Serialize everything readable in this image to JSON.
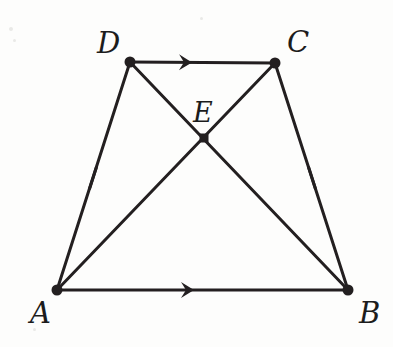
{
  "figure": {
    "background_color": "#fdfdfc",
    "stroke_color": "#231f20",
    "canvas": {
      "width": 393,
      "height": 347
    }
  },
  "points": [
    {
      "id": "A",
      "label": "A",
      "x": 57,
      "y": 290,
      "label_x": 30,
      "label_y": 299
    },
    {
      "id": "B",
      "label": "B",
      "x": 348,
      "y": 290,
      "label_x": 359,
      "label_y": 299
    },
    {
      "id": "C",
      "label": "C",
      "x": 275,
      "y": 63,
      "label_x": 287,
      "label_y": 28
    },
    {
      "id": "D",
      "label": "D",
      "x": 130,
      "y": 62,
      "label_x": 97,
      "label_y": 29
    },
    {
      "id": "E",
      "label": "E",
      "x": 204,
      "y": 138,
      "label_x": 193,
      "label_y": 99
    }
  ],
  "segments": [
    {
      "name": "segment-DC",
      "from": "D",
      "to": "C",
      "arrow_marks": 1,
      "tick_marks": 0
    },
    {
      "name": "segment-AB",
      "from": "A",
      "to": "B",
      "arrow_marks": 1,
      "tick_marks": 0
    },
    {
      "name": "segment-AD",
      "from": "A",
      "to": "D",
      "arrow_marks": 0,
      "tick_marks": 1
    },
    {
      "name": "segment-BC",
      "from": "B",
      "to": "C",
      "arrow_marks": 0,
      "tick_marks": 1
    },
    {
      "name": "diagonal-DB",
      "from": "D",
      "to": "B",
      "arrow_marks": 0,
      "tick_marks": 0
    },
    {
      "name": "diagonal-AC",
      "from": "A",
      "to": "C",
      "arrow_marks": 0,
      "tick_marks": 0
    }
  ],
  "annotations": {
    "parallel_arrows": [
      {
        "name": "arrow-on-DC",
        "x": 190,
        "y": 62,
        "angle": 0.4
      },
      {
        "name": "arrow-on-AB",
        "x": 192,
        "y": 290,
        "angle": 0
      }
    ],
    "congruence_ticks": [
      {
        "name": "tick-on-AD",
        "x": 93,
        "y": 178,
        "angle": -72
      },
      {
        "name": "tick-on-BC",
        "x": 312,
        "y": 178,
        "angle": 72
      }
    ]
  },
  "style": {
    "line_width": 3,
    "vertex_dot_radius": 5,
    "label_font_size": 29
  }
}
